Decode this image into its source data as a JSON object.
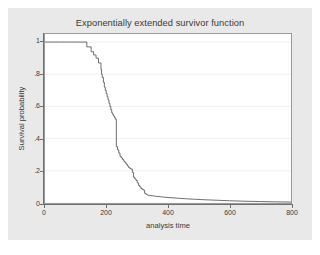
{
  "chart_data": {
    "type": "line",
    "title": "Exponentially extended survivor function",
    "xlabel": "analysis time",
    "ylabel": "Survival probability",
    "xlim": [
      0,
      800
    ],
    "ylim": [
      0,
      1.05
    ],
    "grid": true,
    "legend": null,
    "xticks": [
      0,
      200,
      400,
      600,
      800
    ],
    "xtick_labels": [
      "0",
      "200",
      "400",
      "600",
      "800"
    ],
    "yticks": [
      0,
      0.2,
      0.4,
      0.6,
      0.8,
      1
    ],
    "ytick_labels": [
      "0",
      ".2",
      ".4",
      ".6",
      ".8",
      "1"
    ],
    "series": [
      {
        "name": "survivor function",
        "style": "step-then-smooth",
        "color": "#555555",
        "x": [
          0,
          20,
          50,
          80,
          110,
          134,
          136,
          143,
          150,
          152,
          158,
          160,
          166,
          168,
          174,
          176,
          182,
          184,
          186,
          190,
          193,
          196,
          199,
          202,
          205,
          208,
          211,
          214,
          217,
          220,
          223,
          226,
          229,
          231,
          232,
          236,
          240,
          244,
          248,
          252,
          256,
          260,
          264,
          268,
          272,
          276,
          280,
          284,
          288,
          292,
          296,
          300,
          304,
          308,
          312,
          316,
          320,
          324,
          328,
          332,
          340,
          360,
          380,
          400,
          430,
          460,
          490,
          520,
          560,
          600,
          650,
          700,
          750,
          800
        ],
        "y": [
          1.0,
          1.0,
          1.0,
          1.0,
          1.0,
          1.0,
          0.97,
          0.97,
          0.94,
          0.94,
          0.92,
          0.92,
          0.9,
          0.9,
          0.87,
          0.87,
          0.83,
          0.8,
          0.78,
          0.75,
          0.72,
          0.7,
          0.68,
          0.66,
          0.64,
          0.62,
          0.6,
          0.58,
          0.56,
          0.55,
          0.54,
          0.53,
          0.52,
          0.52,
          0.35,
          0.33,
          0.31,
          0.29,
          0.28,
          0.27,
          0.26,
          0.25,
          0.24,
          0.23,
          0.22,
          0.215,
          0.21,
          0.19,
          0.16,
          0.15,
          0.14,
          0.125,
          0.11,
          0.1,
          0.09,
          0.085,
          0.08,
          0.06,
          0.055,
          0.05,
          0.047,
          0.042,
          0.038,
          0.034,
          0.03,
          0.026,
          0.023,
          0.02,
          0.017,
          0.014,
          0.011,
          0.009,
          0.007,
          0.006
        ]
      }
    ]
  }
}
